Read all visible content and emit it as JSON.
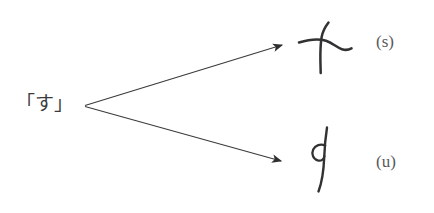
{
  "figure": {
    "type": "branching-derivation-diagram",
    "background_color": "#ffffff",
    "ink_color": "#3a3a3c",
    "source": {
      "text": "「す」",
      "reading": "su",
      "description": "Japanese hiragana su in corner brackets"
    },
    "branches": [
      {
        "id": "top",
        "label": "(s)",
        "glyph_name": "handwritten-cross-stroke",
        "glyph_description": "cursive cross-shaped stroke: long vertical stroke crossed by a wavy horizontal stroke"
      },
      {
        "id": "bottom",
        "label": "(u)",
        "glyph_name": "handwritten-looped-stroke",
        "glyph_description": "cursive long descending stroke with a small loop near the upper left"
      }
    ],
    "arrows": [
      {
        "name": "arrow-to-top-glyph",
        "from": "「す」",
        "to": "(s)"
      },
      {
        "name": "arrow-to-bottom-glyph",
        "from": "「す」",
        "to": "(u)"
      }
    ]
  }
}
